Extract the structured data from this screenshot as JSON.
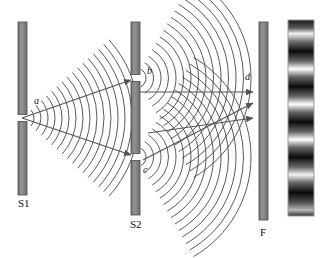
{
  "figure": {
    "background_color": "#ffffff",
    "barrier_color": "#8c8c8c",
    "barrier_edge_color": "#4a4a4a",
    "wave_color": "#3c3c3c",
    "ray_color": "#555555",
    "label_color": "#111111"
  },
  "barriers": [
    {
      "id": "S1",
      "label": "S1",
      "label_x": 18,
      "label_y": 207,
      "x": 18,
      "y": 22,
      "width": 9,
      "height": 173,
      "slits": [
        {
          "name": "a",
          "y": 118
        }
      ]
    },
    {
      "id": "S2",
      "label": "S2",
      "label_x": 130,
      "label_y": 228,
      "x": 131,
      "y": 22,
      "width": 9,
      "height": 193,
      "slits": [
        {
          "name": "b",
          "y": 78
        },
        {
          "name": "c",
          "y": 157
        }
      ]
    },
    {
      "id": "F",
      "label": "F",
      "label_x": 260,
      "label_y": 236,
      "x": 259,
      "y": 22,
      "width": 9,
      "height": 198,
      "slits": []
    }
  ],
  "points": [
    {
      "name": "a",
      "label": "a",
      "x": 22,
      "y": 118,
      "label_x": 34,
      "label_y": 104
    },
    {
      "name": "b",
      "label": "b",
      "x": 136,
      "y": 78,
      "label_x": 147,
      "label_y": 74
    },
    {
      "name": "c",
      "label": "c",
      "x": 136,
      "y": 157,
      "label_x": 143,
      "label_y": 173
    },
    {
      "name": "d",
      "label": "d",
      "x": 252,
      "y": 93,
      "label_x": 245,
      "label_y": 80
    }
  ],
  "rays": [
    {
      "from": "a",
      "to": "b",
      "x1": 22,
      "y1": 118,
      "x2": 131,
      "y2": 80
    },
    {
      "from": "a",
      "to": "c",
      "x1": 22,
      "y1": 118,
      "x2": 131,
      "y2": 155
    },
    {
      "from": "b",
      "to": "d",
      "x1": 140,
      "y1": 92,
      "x2": 253,
      "y2": 92
    },
    {
      "from": "c",
      "to": "d",
      "x1": 143,
      "y1": 160,
      "x2": 253,
      "y2": 103
    },
    {
      "from": "c",
      "to": "d2",
      "x1": 148,
      "y1": 133,
      "x2": 253,
      "y2": 118
    }
  ],
  "wavefronts": [
    {
      "source": "a",
      "cx": 22,
      "cy": 118,
      "count": 16,
      "spacing": 7.0,
      "r0": 12,
      "angle_deg": 42,
      "direction": "right"
    },
    {
      "source": "b",
      "cx": 136,
      "cy": 78,
      "count": 15,
      "spacing": 7.5,
      "r0": 10,
      "angle_deg": 60,
      "direction": "right"
    },
    {
      "source": "c",
      "cx": 136,
      "cy": 157,
      "count": 15,
      "spacing": 7.5,
      "r0": 10,
      "angle_deg": 60,
      "direction": "right"
    }
  ],
  "fringe_pattern": {
    "name": "interference-fringes",
    "x": 288,
    "y": 20,
    "width": 26,
    "height": 196,
    "border_color": "#9a9a9a",
    "description": "Vertical strip of horizontal bright and dark interference fringes",
    "bands": [
      {
        "position_pct": 0,
        "intensity": 0.1
      },
      {
        "position_pct": 4,
        "intensity": 0.35
      },
      {
        "position_pct": 7,
        "intensity": 0.95
      },
      {
        "position_pct": 11,
        "intensity": 0.45
      },
      {
        "position_pct": 16,
        "intensity": 0.05
      },
      {
        "position_pct": 21,
        "intensity": 0.4
      },
      {
        "position_pct": 25,
        "intensity": 1.0
      },
      {
        "position_pct": 29,
        "intensity": 0.4
      },
      {
        "position_pct": 34,
        "intensity": 0.05
      },
      {
        "position_pct": 39,
        "intensity": 0.4
      },
      {
        "position_pct": 43,
        "intensity": 1.0
      },
      {
        "position_pct": 47,
        "intensity": 0.4
      },
      {
        "position_pct": 52,
        "intensity": 0.05
      },
      {
        "position_pct": 57,
        "intensity": 0.4
      },
      {
        "position_pct": 61,
        "intensity": 1.0
      },
      {
        "position_pct": 65,
        "intensity": 0.4
      },
      {
        "position_pct": 70,
        "intensity": 0.05
      },
      {
        "position_pct": 75,
        "intensity": 0.4
      },
      {
        "position_pct": 79,
        "intensity": 0.95
      },
      {
        "position_pct": 83,
        "intensity": 0.4
      },
      {
        "position_pct": 88,
        "intensity": 0.05
      },
      {
        "position_pct": 93,
        "intensity": 0.3
      },
      {
        "position_pct": 97,
        "intensity": 0.7
      },
      {
        "position_pct": 100,
        "intensity": 0.2
      }
    ]
  }
}
